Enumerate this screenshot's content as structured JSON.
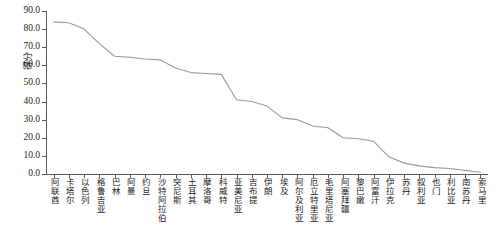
{
  "chart_data": {
    "type": "line",
    "title": "",
    "xlabel": "",
    "ylabel": "得分",
    "ylim": [
      0,
      90
    ],
    "yticks": [
      0,
      10,
      20,
      30,
      40,
      50,
      60,
      70,
      80,
      90
    ],
    "ytick_labels": [
      "0.0",
      "10.0",
      "20.0",
      "30.0",
      "40.0",
      "50.0",
      "60.0",
      "70.0",
      "80.0",
      "90.0"
    ],
    "grid": false,
    "legend": "none",
    "line_color": "#9a9a9a",
    "categories": [
      "阿联酋",
      "卡塔尔",
      "以色列",
      "格鲁吉亚",
      "巴林",
      "阿曼",
      "约旦",
      "沙特阿拉伯",
      "突尼斯",
      "土耳其",
      "摩洛哥",
      "科威特",
      "亚美尼亚",
      "吉布提",
      "伊朗",
      "埃及",
      "阿尔及利亚",
      "厄立特里亚",
      "毛里塔尼亚",
      "阿塞拜疆",
      "黎巴嫩",
      "阿富汗",
      "伊拉克",
      "苏丹",
      "叙利亚",
      "也门",
      "利比亚",
      "南苏丹",
      "索马里"
    ],
    "values": [
      84.0,
      83.5,
      80.0,
      72.0,
      65.0,
      64.5,
      63.5,
      63.0,
      58.5,
      56.0,
      55.5,
      55.0,
      41.0,
      40.0,
      37.5,
      31.0,
      30.0,
      26.5,
      25.5,
      20.0,
      19.5,
      18.0,
      9.5,
      6.0,
      4.5,
      3.5,
      3.0,
      2.0,
      1.0
    ]
  }
}
